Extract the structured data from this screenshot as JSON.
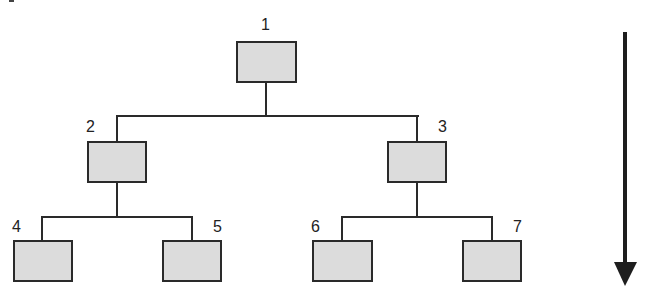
{
  "diagram": {
    "type": "binary-tree",
    "nodes": [
      {
        "id": 1,
        "label": "1",
        "x": 236,
        "y": 41
      },
      {
        "id": 2,
        "label": "2",
        "x": 87,
        "y": 141
      },
      {
        "id": 3,
        "label": "3",
        "x": 387,
        "y": 141
      },
      {
        "id": 4,
        "label": "4",
        "x": 13,
        "y": 240
      },
      {
        "id": 5,
        "label": "5",
        "x": 162,
        "y": 240
      },
      {
        "id": 6,
        "label": "6",
        "x": 312,
        "y": 240
      },
      {
        "id": 7,
        "label": "7",
        "x": 462,
        "y": 240
      }
    ],
    "edges": [
      [
        1,
        2
      ],
      [
        1,
        3
      ],
      [
        2,
        4
      ],
      [
        2,
        5
      ],
      [
        3,
        6
      ],
      [
        3,
        7
      ]
    ],
    "arrow": {
      "direction": "down",
      "meaning": "top-down traversal"
    },
    "colors": {
      "node_fill": "#dcdcdc",
      "stroke": "#2a2a2a",
      "background": "#ffffff"
    }
  }
}
